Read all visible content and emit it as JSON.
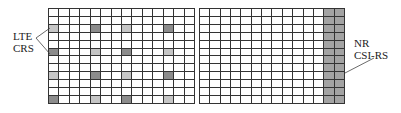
{
  "diagram": {
    "left_grid": {
      "name": "LTE resource grid",
      "rows": 12,
      "cols": 14,
      "shaded_cells": [
        {
          "row": 2,
          "col": 0,
          "shade": "light"
        },
        {
          "row": 2,
          "col": 4,
          "shade": "dark"
        },
        {
          "row": 2,
          "col": 7,
          "shade": "light"
        },
        {
          "row": 2,
          "col": 11,
          "shade": "dark"
        },
        {
          "row": 5,
          "col": 0,
          "shade": "dark"
        },
        {
          "row": 5,
          "col": 4,
          "shade": "light"
        },
        {
          "row": 5,
          "col": 7,
          "shade": "dark"
        },
        {
          "row": 5,
          "col": 11,
          "shade": "light"
        },
        {
          "row": 8,
          "col": 0,
          "shade": "light"
        },
        {
          "row": 8,
          "col": 4,
          "shade": "dark"
        },
        {
          "row": 8,
          "col": 7,
          "shade": "light"
        },
        {
          "row": 8,
          "col": 11,
          "shade": "dark"
        },
        {
          "row": 11,
          "col": 0,
          "shade": "dark"
        },
        {
          "row": 11,
          "col": 4,
          "shade": "light"
        },
        {
          "row": 11,
          "col": 7,
          "shade": "dark"
        },
        {
          "row": 11,
          "col": 11,
          "shade": "light"
        }
      ],
      "label_line1": "LTE",
      "label_line2": "CRS"
    },
    "right_grid": {
      "name": "NR resource grid",
      "rows": 12,
      "cols": 14,
      "shaded_columns": [
        12,
        13
      ],
      "label_line1": "NR",
      "label_line2": "CSI-RS"
    },
    "colors": {
      "grid_line": "#333333",
      "light_shade": "#c6c6c6",
      "dark_shade": "#8c8c8c",
      "nr_shade": "#a3a3a3"
    }
  }
}
